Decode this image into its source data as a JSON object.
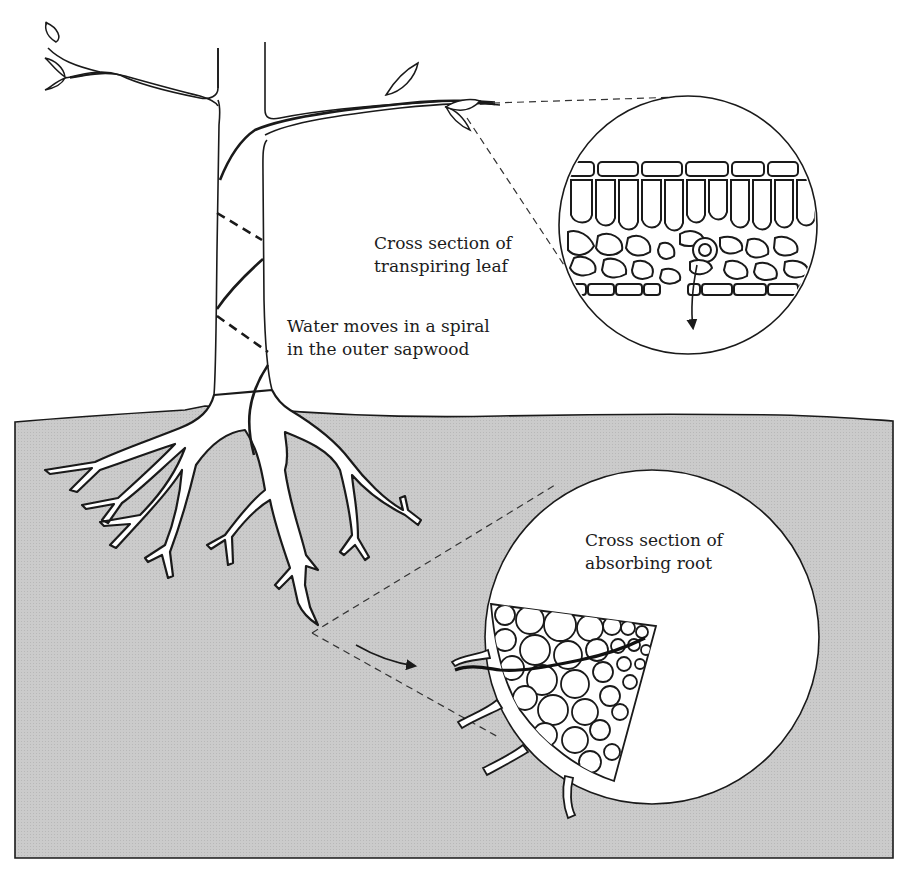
{
  "diagram": {
    "type": "illustration",
    "colors": {
      "soil": "#c9c9c9",
      "line": "#1a1a1a",
      "background": "#ffffff"
    },
    "labels": {
      "leaf_section": {
        "line1": "Cross section of",
        "line2": "transpiring leaf"
      },
      "spiral": {
        "line1": "Water moves in a spiral",
        "line2": "in the outer sapwood"
      },
      "root_section": {
        "line1": "Cross section of",
        "line2": "absorbing root"
      }
    },
    "callouts": [
      {
        "name": "leaf-detail",
        "source": "leaf on right branch tip",
        "circle": {
          "cx": 688,
          "cy": 225,
          "r": 129
        }
      },
      {
        "name": "root-detail",
        "source": "root tip",
        "circle": {
          "cx": 652,
          "cy": 637,
          "r": 167
        }
      }
    ]
  }
}
